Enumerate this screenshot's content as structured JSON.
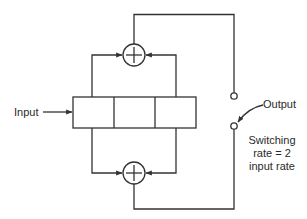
{
  "diagram": {
    "type": "convolutional-encoder",
    "labels": {
      "input": "Input",
      "output": "Output",
      "note_line1": "Switching",
      "note_line2": "rate = 2",
      "note_line3": "input rate"
    },
    "shift_register": {
      "stages": 3
    },
    "adders": [
      {
        "name": "upper-adder",
        "symbol": "+"
      },
      {
        "name": "lower-adder",
        "symbol": "+"
      }
    ],
    "switch_terminals": 2,
    "colors": {
      "line": "#333333",
      "background": "#ffffff"
    }
  }
}
